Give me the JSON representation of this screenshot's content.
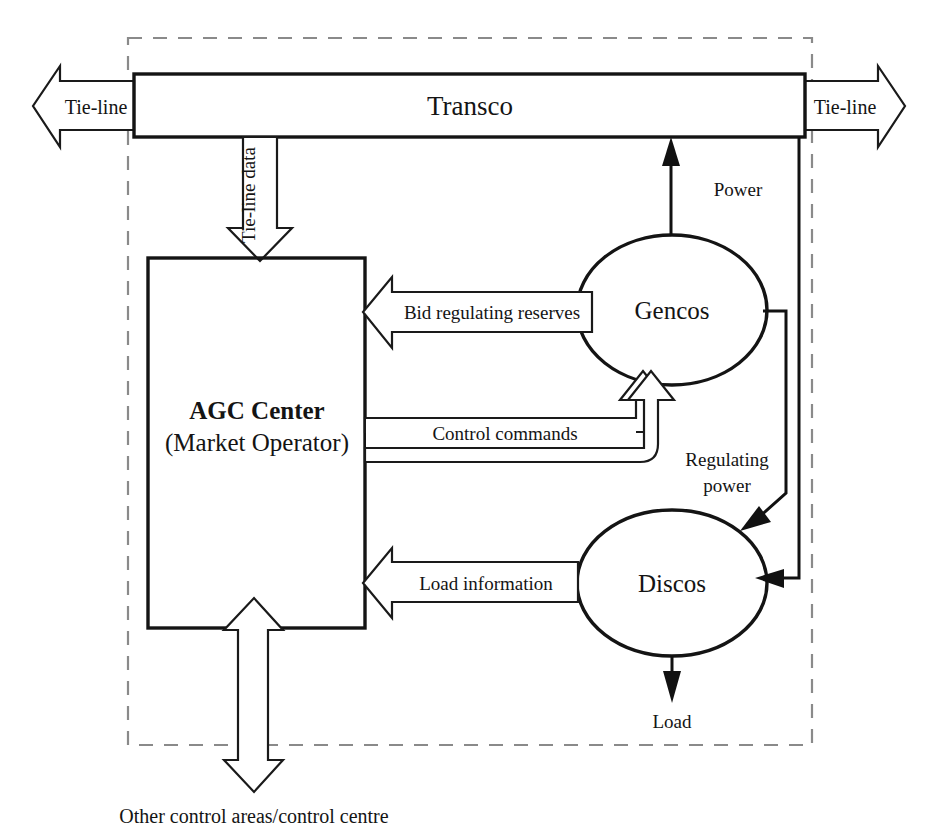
{
  "diagram": {
    "control_area_boundary": "dashed control area boundary",
    "nodes": {
      "transco": {
        "label": "Transco",
        "shape": "rectangle"
      },
      "agc": {
        "label_line1": "AGC Center",
        "label_line2": "(Market Operator)",
        "shape": "rectangle"
      },
      "gencos": {
        "label": "Gencos",
        "shape": "ellipse"
      },
      "discos": {
        "label": "Discos",
        "shape": "ellipse"
      }
    },
    "flows": {
      "tie_line_left": "Tie-line",
      "tie_line_right": "Tie-line",
      "tie_line_data": "Tie-line data",
      "bid_regulating_reserves": "Bid regulating reserves",
      "control_commands": "Control commands",
      "load_information": "Load information",
      "power": "Power",
      "regulating_power_line1": "Regulating",
      "regulating_power_line2": "power",
      "load": "Load"
    },
    "caption": "Other control areas/control centre",
    "colors": {
      "ink": "#141414",
      "boundary": "#8a8a8a",
      "background": "#ffffff"
    }
  }
}
